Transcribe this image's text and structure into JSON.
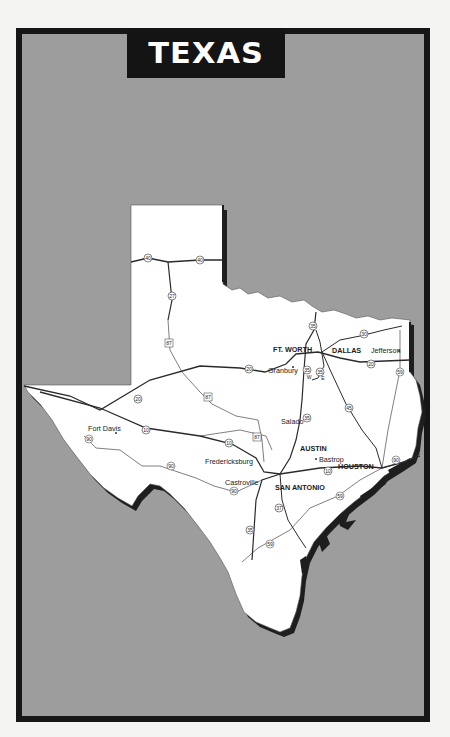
{
  "title": "TEXAS",
  "colors": {
    "background": "#f4f4f2",
    "frame": "#161616",
    "sea_fill": "#9d9d9d",
    "land": "#ffffff",
    "shadow": "#1e1e1e",
    "roads": "#2a2a2a"
  },
  "cities": [
    {
      "name": "FT. WORTH",
      "major": true
    },
    {
      "name": "DALLAS",
      "major": true
    },
    {
      "name": "Jefferson",
      "major": false
    },
    {
      "name": "Granbury",
      "major": false
    },
    {
      "name": "Salado",
      "major": false
    },
    {
      "name": "AUSTIN",
      "major": true
    },
    {
      "name": "Bastrop",
      "major": false
    },
    {
      "name": "HOUSTON",
      "major": true
    },
    {
      "name": "Fort Davis",
      "major": false
    },
    {
      "name": "Fredericksburg",
      "major": false
    },
    {
      "name": "Castroville",
      "major": false
    },
    {
      "name": "SAN ANTONIO",
      "major": true
    }
  ],
  "highways": {
    "i40_west": "40",
    "i40_east": "40",
    "i27": "27",
    "us87_north": "87",
    "us87_mid": "87",
    "us87_south": "87",
    "i20_west": "20",
    "i20_mid": "20",
    "i20_east": "20",
    "i10_west": "10",
    "i10_mid": "10",
    "i10_east": "10",
    "i35_north": "35",
    "i35w": "35",
    "i35w_suffix": "W",
    "i35e": "35",
    "i35e_suffix": "E",
    "i35_central": "35",
    "i35_south": "35",
    "i30": "30",
    "i45": "45",
    "i37": "37",
    "us59_north": "59",
    "us59_mid": "59",
    "us59_south": "59",
    "us90_west": "90",
    "us90_mid": "90",
    "us90_castroville": "90",
    "us90_east": "90"
  }
}
